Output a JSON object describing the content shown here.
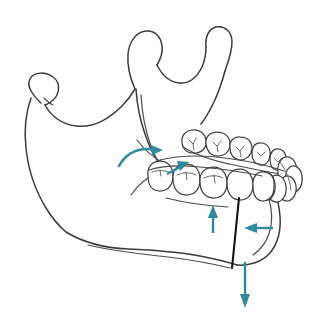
{
  "figure": {
    "title": "Mandible osteotomy force diagram",
    "style": "line art medical illustration",
    "background_color": "#ffffff",
    "outline_color": "#3a3a3a",
    "cut_line_color": "#141414",
    "arrow_color": "#2e8a9c",
    "caption": "",
    "labels": []
  },
  "anatomy": {
    "parts": [
      {
        "name": "left-condyle",
        "label": "Condyle (near side)"
      },
      {
        "name": "coronoid-process",
        "label": "Coronoid process"
      },
      {
        "name": "right-condyle",
        "label": "Condyle (far side)"
      },
      {
        "name": "sigmoid-notch",
        "label": "Mandibular notch"
      },
      {
        "name": "ramus",
        "label": "Ramus"
      },
      {
        "name": "gonial-angle",
        "label": "Angle of mandible"
      },
      {
        "name": "body",
        "label": "Body of mandible"
      },
      {
        "name": "symphysis",
        "label": "Symphysis / chin"
      },
      {
        "name": "dental-arch",
        "label": "Dental arch"
      }
    ]
  },
  "teeth": {
    "far_row_label": "Far side posterior teeth",
    "near_row_label": "Near side posterior teeth",
    "anterior_label": "Anterior teeth",
    "far_row_count": 5,
    "near_row_count": 5,
    "anterior_count": 5
  },
  "osteotomy": {
    "name": "vertical-osteotomy-cut",
    "label": "Osteotomy cut line",
    "orientation": "vertical",
    "color": "#141414"
  },
  "arrows": [
    {
      "name": "rotation-arrow",
      "label": "Rotational force",
      "shape": "curved",
      "direction": "counter-clockwise sweep toward superior-posterior",
      "color": "#2e8a9c"
    },
    {
      "name": "molar-superior-arrow",
      "label": "Superior force at molars",
      "shape": "straight",
      "direction": "up-right",
      "color": "#2e8a9c"
    },
    {
      "name": "body-superior-arrow",
      "label": "Superior force at body",
      "shape": "straight",
      "direction": "up",
      "color": "#2e8a9c"
    },
    {
      "name": "chin-posterior-arrow",
      "label": "Posterior force at chin",
      "shape": "straight",
      "direction": "left",
      "color": "#2e8a9c"
    },
    {
      "name": "chin-inferior-arrow",
      "label": "Inferior force at chin segment",
      "shape": "straight",
      "direction": "down",
      "color": "#2e8a9c"
    }
  ]
}
